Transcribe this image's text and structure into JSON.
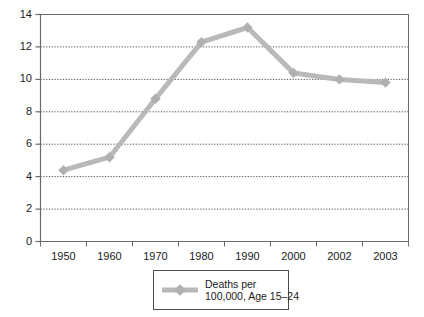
{
  "chart_data": {
    "type": "line",
    "title": "",
    "subtitle": "",
    "xlabel": "",
    "ylabel": "",
    "categories": [
      "1950",
      "1960",
      "1970",
      "1980",
      "1990",
      "2000",
      "2002",
      "2003"
    ],
    "x": [
      1950,
      1960,
      1970,
      1980,
      1990,
      2000,
      2002,
      2003
    ],
    "values": [
      4.4,
      5.2,
      8.8,
      12.3,
      13.2,
      10.4,
      10.0,
      9.8
    ],
    "series": [
      {
        "name": "Deaths per 100,000, Age 15–24",
        "values": [
          4.4,
          5.2,
          8.8,
          12.3,
          13.2,
          10.4,
          10.0,
          9.8
        ]
      }
    ],
    "ylim": [
      0,
      14
    ],
    "yticks": [
      0,
      2,
      4,
      6,
      8,
      10,
      12,
      14
    ],
    "ytick_labels": [
      "0",
      "2",
      "4",
      "6",
      "8",
      "10",
      "12",
      "14"
    ],
    "xtick_labels": [
      "1950",
      "1960",
      "1970",
      "1980",
      "1990",
      "2000",
      "2002",
      "2003"
    ],
    "grid": "horizontal-dotted",
    "legend_position": "bottom-center",
    "marker": "diamond",
    "colors": {
      "series_line": "#b9b9b9",
      "marker": "#b0b0b0",
      "gridline": "#4d4d4d",
      "axis": "#6b6b6b",
      "border": "#6b6b6b",
      "text": "#1a1a1a",
      "background": "#ffffff"
    }
  },
  "legend": {
    "entries": [
      {
        "label_line1": "Deaths per",
        "label_line2": "100,000, Age 15–24",
        "label_full": "Deaths per 100,000, Age 15–24",
        "swatch_icon": "diamond-line-marker-icon"
      }
    ]
  },
  "axes": {
    "y": {
      "labels": [
        "14",
        "12",
        "10",
        "8",
        "6",
        "4",
        "2",
        "0"
      ]
    },
    "x": {
      "labels": [
        "1950",
        "1960",
        "1970",
        "1980",
        "1990",
        "2000",
        "2002",
        "2003"
      ]
    }
  }
}
